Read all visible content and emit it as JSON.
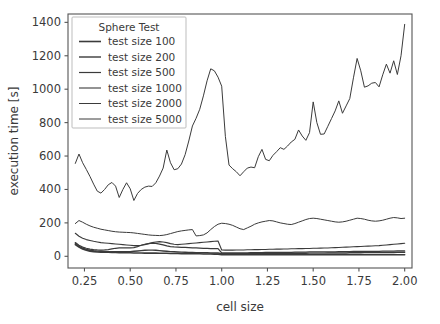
{
  "chart_data": {
    "type": "line",
    "title": "",
    "xlabel": "cell size",
    "ylabel": "execution time [s]",
    "xlim": [
      0.16,
      2.04
    ],
    "ylim": [
      -70,
      1450
    ],
    "xticks": [
      "0.25",
      "0.50",
      "0.75",
      "1.00",
      "1.25",
      "1.50",
      "1.75",
      "2.00"
    ],
    "xtick_values": [
      0.25,
      0.5,
      0.75,
      1.0,
      1.25,
      1.5,
      1.75,
      2.0
    ],
    "yticks": [
      "0",
      "200",
      "400",
      "600",
      "800",
      "1000",
      "1200",
      "1400"
    ],
    "ytick_values": [
      0,
      200,
      400,
      600,
      800,
      1000,
      1200,
      1400
    ],
    "grid": false,
    "legend_position": "upper left",
    "legend_title": "Sphere Test",
    "x": [
      0.2,
      0.22,
      0.24,
      0.26,
      0.28,
      0.3,
      0.32,
      0.34,
      0.36,
      0.38,
      0.4,
      0.42,
      0.44,
      0.46,
      0.48,
      0.5,
      0.52,
      0.54,
      0.56,
      0.58,
      0.6,
      0.62,
      0.64,
      0.66,
      0.68,
      0.7,
      0.72,
      0.74,
      0.76,
      0.78,
      0.8,
      0.82,
      0.84,
      0.86,
      0.88,
      0.9,
      0.92,
      0.94,
      0.96,
      0.98,
      1.0,
      1.02,
      1.04,
      1.06,
      1.08,
      1.1,
      1.12,
      1.14,
      1.16,
      1.18,
      1.2,
      1.22,
      1.24,
      1.26,
      1.28,
      1.3,
      1.32,
      1.34,
      1.36,
      1.38,
      1.4,
      1.42,
      1.44,
      1.46,
      1.48,
      1.5,
      1.52,
      1.54,
      1.56,
      1.58,
      1.6,
      1.62,
      1.64,
      1.66,
      1.68,
      1.7,
      1.72,
      1.74,
      1.76,
      1.78,
      1.8,
      1.82,
      1.84,
      1.86,
      1.88,
      1.9,
      1.92,
      1.94,
      1.96,
      1.98,
      2.0
    ],
    "series": [
      {
        "name": "test size 100",
        "linewidth": 1.6,
        "color": "#1f1f1f",
        "values": [
          70,
          55,
          44,
          36,
          31,
          28,
          26,
          25,
          24,
          24,
          23,
          23,
          22,
          22,
          21,
          21,
          20,
          20,
          20,
          19,
          19,
          19,
          19,
          18,
          18,
          18,
          17,
          17,
          17,
          16,
          16,
          16,
          15,
          15,
          15,
          14,
          14,
          14,
          13,
          13,
          9,
          9,
          9,
          9,
          9,
          9,
          9,
          9,
          9,
          9,
          9,
          9,
          9,
          9,
          9,
          9,
          9,
          9,
          9,
          9,
          9,
          9,
          9,
          9,
          9,
          9,
          9,
          9,
          9,
          9,
          9,
          9,
          9,
          9,
          9,
          9,
          9,
          9,
          9,
          9,
          9,
          9,
          9,
          9,
          9,
          9,
          9,
          9,
          9,
          9,
          9
        ]
      },
      {
        "name": "test size 200",
        "linewidth": 1.4,
        "color": "#2e2e2e",
        "values": [
          78,
          60,
          48,
          41,
          36,
          33,
          31,
          30,
          29,
          28,
          28,
          28,
          27,
          27,
          27,
          28,
          30,
          32,
          34,
          36,
          37,
          37,
          36,
          34,
          32,
          30,
          28,
          27,
          26,
          25,
          24,
          23,
          23,
          22,
          22,
          21,
          21,
          20,
          20,
          20,
          16,
          16,
          16,
          16,
          16,
          16,
          16,
          16,
          17,
          17,
          17,
          17,
          17,
          17,
          17,
          17,
          17,
          18,
          18,
          18,
          18,
          18,
          18,
          18,
          19,
          19,
          19,
          19,
          19,
          20,
          20,
          20,
          20,
          20,
          20,
          21,
          21,
          21,
          21,
          22,
          22,
          22,
          22,
          22,
          23,
          23,
          23,
          23,
          24,
          24,
          24
        ]
      },
      {
        "name": "test size 500",
        "linewidth": 1.2,
        "color": "#3a3a3a",
        "values": [
          82,
          66,
          55,
          48,
          43,
          40,
          38,
          37,
          38,
          40,
          44,
          48,
          50,
          51,
          51,
          50,
          52,
          58,
          66,
          72,
          76,
          78,
          77,
          73,
          68,
          62,
          58,
          56,
          55,
          54,
          53,
          52,
          51,
          50,
          49,
          48,
          47,
          46,
          46,
          46,
          20,
          20,
          20,
          20,
          21,
          21,
          21,
          21,
          22,
          22,
          22,
          22,
          23,
          23,
          23,
          23,
          24,
          24,
          24,
          24,
          25,
          25,
          25,
          25,
          26,
          26,
          26,
          26,
          27,
          27,
          27,
          27,
          28,
          28,
          28,
          28,
          29,
          29,
          29,
          29,
          30,
          30,
          30,
          30,
          31,
          31,
          31,
          31,
          32,
          32,
          32
        ]
      },
      {
        "name": "test size 1000",
        "linewidth": 1.1,
        "color": "#464646",
        "values": [
          138,
          120,
          108,
          100,
          95,
          90,
          86,
          82,
          80,
          78,
          76,
          74,
          72,
          70,
          68,
          66,
          64,
          64,
          66,
          70,
          76,
          82,
          86,
          88,
          86,
          82,
          76,
          72,
          70,
          72,
          74,
          76,
          78,
          80,
          82,
          84,
          86,
          88,
          90,
          92,
          38,
          37,
          37,
          37,
          38,
          38,
          38,
          39,
          39,
          40,
          40,
          41,
          41,
          42,
          42,
          43,
          43,
          44,
          44,
          45,
          45,
          46,
          46,
          47,
          47,
          48,
          48,
          49,
          50,
          50,
          51,
          52,
          53,
          54,
          55,
          56,
          57,
          58,
          59,
          60,
          61,
          62,
          63,
          64,
          66,
          68,
          70,
          72,
          74,
          76,
          78
        ]
      },
      {
        "name": "test size 2000",
        "linewidth": 1.0,
        "color": "#4f4f4f",
        "values": [
          196,
          214,
          204,
          192,
          182,
          174,
          168,
          162,
          158,
          154,
          150,
          147,
          145,
          144,
          143,
          142,
          140,
          137,
          134,
          131,
          128,
          126,
          125,
          124,
          126,
          130,
          136,
          142,
          148,
          152,
          155,
          158,
          160,
          122,
          124,
          128,
          140,
          160,
          178,
          192,
          198,
          196,
          192,
          185,
          175,
          165,
          160,
          170,
          180,
          192,
          200,
          206,
          210,
          214,
          212,
          206,
          200,
          196,
          192,
          190,
          196,
          204,
          212,
          220,
          226,
          228,
          226,
          222,
          218,
          214,
          210,
          206,
          204,
          206,
          210,
          216,
          222,
          228,
          226,
          222,
          216,
          212,
          210,
          212,
          216,
          222,
          228,
          232,
          230,
          226,
          228
        ]
      },
      {
        "name": "test size 5000",
        "linewidth": 1.0,
        "color": "#5a5a5a",
        "values": [
          556,
          612,
          560,
          520,
          478,
          432,
          390,
          378,
          400,
          428,
          442,
          420,
          352,
          400,
          440,
          404,
          334,
          376,
          400,
          414,
          420,
          418,
          440,
          480,
          528,
          636,
          560,
          518,
          524,
          552,
          608,
          690,
          780,
          826,
          880,
          960,
          1050,
          1122,
          1110,
          1072,
          1018,
          718,
          546,
          524,
          506,
          482,
          506,
          528,
          534,
          530,
          596,
          640,
          580,
          572,
          604,
          626,
          650,
          640,
          660,
          684,
          700,
          756,
          720,
          694,
          740,
          924,
          800,
          730,
          732,
          778,
          824,
          870,
          930,
          856,
          900,
          944,
          1068,
          1184,
          1110,
          1012,
          1020,
          1036,
          1040,
          1014,
          1086,
          1150,
          1096,
          1170,
          1088,
          1200,
          1388
        ]
      }
    ]
  },
  "figure": {
    "legend_title": "Sphere Test",
    "legend_entries": [
      "test size 100",
      "test size 200",
      "test size 500",
      "test size 1000",
      "test size 2000",
      "test size 5000"
    ],
    "xlabel": "cell size",
    "ylabel": "execution time [s]",
    "background_color": "#ffffff",
    "axis_color": "#555555",
    "line_color": "#3b3b3b"
  }
}
